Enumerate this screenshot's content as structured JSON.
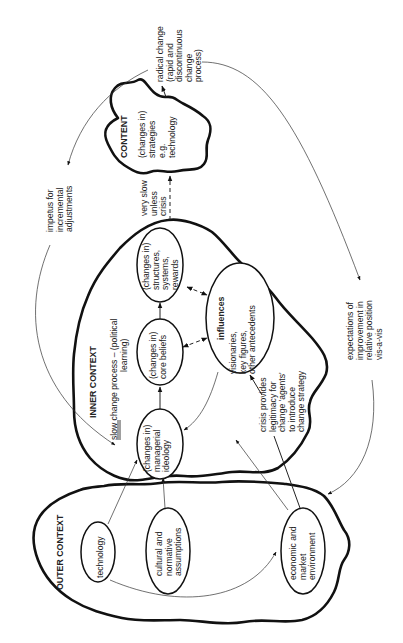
{
  "diagram": {
    "orientation": "rotated-90-ccw",
    "stroke_color": "#111111",
    "background": "#ffffff",
    "regions": {
      "content": {
        "title": "CONTENT",
        "lines": [
          "(changes in)",
          "strategies",
          "e.g.",
          "technology"
        ]
      },
      "inner_context": {
        "title": "INNER CONTEXT",
        "process_line1": "slow change process – (political",
        "process_line2": "learning)",
        "underlined_word": "slow"
      },
      "outer_context": {
        "title": "OUTER CONTEXT"
      }
    },
    "nodes": {
      "managerial_ideology": [
        "(changes in)",
        "managerial",
        "ideology"
      ],
      "core_beliefs": [
        "(changes in)",
        "core beliefs"
      ],
      "structures": [
        "(changes in)",
        "structures,",
        "systems,",
        "rewards"
      ],
      "influences": {
        "title": "influences",
        "lines": [
          "visionaries,",
          "key figures,",
          "other antecedents"
        ]
      },
      "technology": [
        "technology"
      ],
      "cultural": [
        "cultural and",
        "normative",
        "assumptions"
      ],
      "economic": [
        "economic and",
        "market",
        "environment"
      ]
    },
    "annotations": {
      "radical_change": [
        "radical change",
        "(rapid and",
        "discontinuous",
        "change",
        "process)"
      ],
      "impetus": [
        "impetus for",
        "incremental",
        "adjustments"
      ],
      "very_slow": [
        "very slow",
        "unless",
        "crisis"
      ],
      "crisis": [
        "crisis provides",
        "legitimacy for",
        "change 'agents'",
        "to introduce",
        "change strategy"
      ],
      "expectations": [
        "expectations of",
        "improvement in",
        "relative position",
        "vis-a-vis"
      ]
    }
  }
}
